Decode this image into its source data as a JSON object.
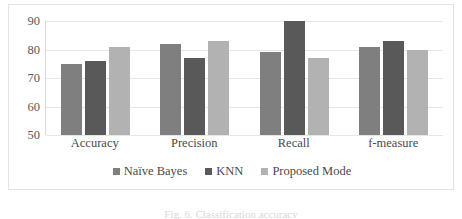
{
  "chart_data": {
    "type": "bar",
    "title": "",
    "subtitle": "",
    "xlabel": "",
    "ylabel": "",
    "categories": [
      "Accuracy",
      "Precision",
      "Recall",
      "f-measure"
    ],
    "series": [
      {
        "name": "Naïve Bayes",
        "values": [
          75,
          82,
          79,
          81
        ],
        "color": "#7f7f7f"
      },
      {
        "name": "KNN",
        "values": [
          76,
          77,
          90,
          83
        ],
        "color": "#595959"
      },
      {
        "name": "Proposed Mode",
        "values": [
          81,
          83,
          77,
          80
        ],
        "color": "#b2b2b2"
      }
    ],
    "ylim": [
      50,
      90
    ],
    "yticks": [
      50,
      60,
      70,
      80,
      90
    ],
    "ytick_labels": [
      "50",
      "60",
      "70",
      "80",
      "90"
    ],
    "grid": "horizontal",
    "legend_position": "bottom-center"
  },
  "caption": {
    "text": "Fig. 6.  Classification accuracy"
  }
}
